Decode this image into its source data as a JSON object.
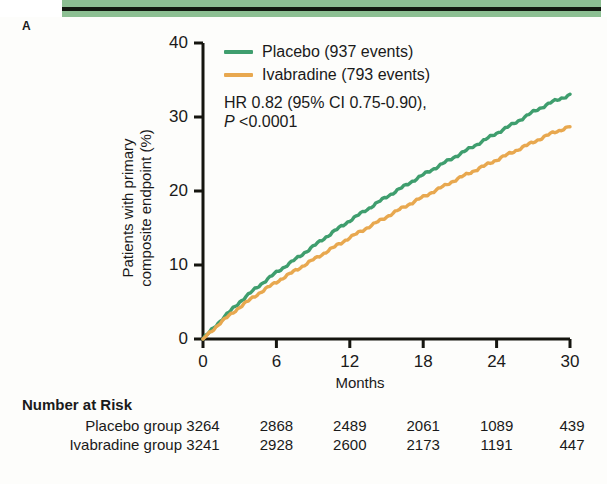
{
  "figure": {
    "panel_label": "A"
  },
  "legend": {
    "items": [
      {
        "label": "Placebo (937 events)",
        "color": "#3f9e6e",
        "name": "placebo"
      },
      {
        "label": "Ivabradine (793 events)",
        "color": "#e8a84f",
        "name": "ivabradine"
      }
    ]
  },
  "stats": {
    "hr_line": "HR 0.82 (95% CI 0.75-0.90),",
    "p_italic": "P",
    "p_rest": " <0.0001"
  },
  "risk_table": {
    "title": "Number at Risk",
    "rows": [
      {
        "label": "Placebo group",
        "values": [
          "3264",
          "2868",
          "2489",
          "2061",
          "1089",
          "439"
        ]
      },
      {
        "label": "Ivabradine group",
        "values": [
          "3241",
          "2928",
          "2600",
          "2173",
          "1191",
          "447"
        ]
      }
    ]
  },
  "chart_data": {
    "type": "line",
    "title": "",
    "xlabel": "Months",
    "ylabel": "Patients with primary composite endpoint (%)",
    "ylabel_line1": "Patients with primary",
    "ylabel_line2": "composite endpoint (%)",
    "xlim": [
      0,
      30
    ],
    "ylim": [
      0,
      40
    ],
    "xticks": [
      0,
      6,
      12,
      18,
      24,
      30
    ],
    "yticks": [
      0,
      10,
      20,
      30,
      40
    ],
    "xtick_labels": [
      "0",
      "6",
      "12",
      "18",
      "24",
      "30"
    ],
    "ytick_labels": [
      "0",
      "10",
      "20",
      "30",
      "40"
    ],
    "grid": false,
    "legend_position": "top-right-inside",
    "annotations": [
      "HR 0.82 (95% CI 0.75-0.90),",
      "P <0.0001"
    ],
    "x": [
      0,
      1.5,
      3,
      4.5,
      6,
      7.5,
      9,
      10.5,
      12,
      13.5,
      15,
      16.5,
      18,
      19.5,
      21,
      22.5,
      24,
      25.5,
      27,
      28.5,
      30
    ],
    "series": [
      {
        "name": "Placebo (937 events)",
        "color": "#3f9e6e",
        "events": 937,
        "values": [
          0,
          2.6,
          5.0,
          7.1,
          9.0,
          10.7,
          12.5,
          14.3,
          16.0,
          17.6,
          19.2,
          20.7,
          22.2,
          23.6,
          25.0,
          26.4,
          27.8,
          29.2,
          30.7,
          32.0,
          33.0
        ]
      },
      {
        "name": "Ivabradine (793 events)",
        "color": "#e8a84f",
        "events": 793,
        "values": [
          0,
          2.3,
          4.3,
          6.1,
          7.7,
          9.2,
          10.7,
          12.2,
          13.7,
          15.1,
          16.5,
          17.9,
          19.2,
          20.5,
          21.8,
          23.0,
          24.2,
          25.4,
          26.6,
          27.8,
          28.7
        ]
      }
    ],
    "hazard_ratio": 0.82,
    "ci_lower": 0.75,
    "ci_upper": 0.9,
    "p_value": "<0.0001"
  }
}
